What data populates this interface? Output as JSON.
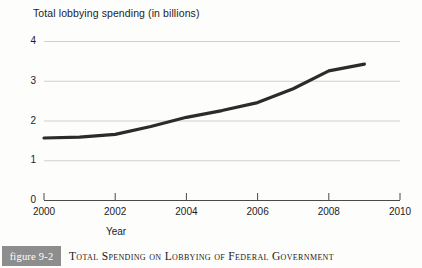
{
  "chart_data": {
    "type": "line",
    "title": "Total lobbying spending (in billions)",
    "xlabel": "Year",
    "ylabel": "",
    "xlim": [
      2000,
      2010
    ],
    "ylim": [
      0,
      4
    ],
    "grid": true,
    "legend": false,
    "x_ticks": [
      "2000",
      "2002",
      "2004",
      "2006",
      "2008",
      "2010"
    ],
    "y_ticks": [
      "0",
      "1",
      "2",
      "3",
      "4"
    ],
    "series": [
      {
        "name": "Total lobbying spending",
        "x": [
          2000,
          2001,
          2002,
          2003,
          2004,
          2005,
          2006,
          2007,
          2008,
          2009
        ],
        "values": [
          1.56,
          1.58,
          1.65,
          1.85,
          2.08,
          2.25,
          2.45,
          2.8,
          3.25,
          3.42
        ]
      }
    ],
    "line_color": "#2b2b2b",
    "gridline_color": "#cfcfcf",
    "axis_color": "#4a4a4a"
  },
  "caption": {
    "figure_label": "figure 9-2",
    "figure_title": "Total Spending on Lobbying of Federal Government",
    "badge_color": "#8d8d8d"
  }
}
